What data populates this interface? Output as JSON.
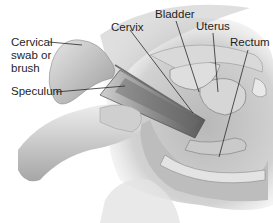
{
  "diagram": {
    "style": "grayscale medical illustration",
    "labels": [
      {
        "id": "cervical-swab",
        "lines": [
          "Cervical",
          "swab or",
          "brush"
        ]
      },
      {
        "id": "speculum",
        "text": "Speculum"
      },
      {
        "id": "cervix",
        "text": "Cervix"
      },
      {
        "id": "bladder",
        "text": "Bladder"
      },
      {
        "id": "uterus",
        "text": "Uterus"
      },
      {
        "id": "rectum",
        "text": "Rectum"
      }
    ]
  },
  "colors": {
    "background": "#ffffff",
    "label_text": "#1e1e1e",
    "leader_line": "#2a2a2a"
  }
}
